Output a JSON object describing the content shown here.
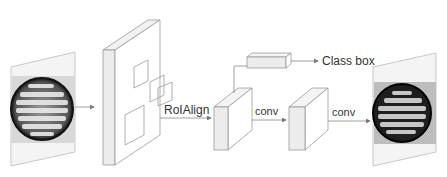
{
  "diagram": {
    "type": "Mask R-CNN pipeline",
    "nodes": [
      {
        "id": "input-image",
        "kind": "image",
        "desc": "petri dish with colonies (input)"
      },
      {
        "id": "feature-map",
        "kind": "feature-map",
        "desc": "backbone feature map with RoI boxes"
      },
      {
        "id": "roi-feature",
        "kind": "cube"
      },
      {
        "id": "class-box-head",
        "kind": "bar"
      },
      {
        "id": "mask-feature",
        "kind": "cube"
      },
      {
        "id": "output-image",
        "kind": "image",
        "desc": "petri dish with masked colonies (output)"
      }
    ],
    "labels": {
      "roialign": "RoIAlign",
      "conv1": "conv",
      "conv2": "conv",
      "class_box": "Class box"
    },
    "colors": {
      "line": "#8a8a8a",
      "face_light": "#f6f6f6",
      "face_mid": "#ececec",
      "text": "#333333"
    }
  }
}
